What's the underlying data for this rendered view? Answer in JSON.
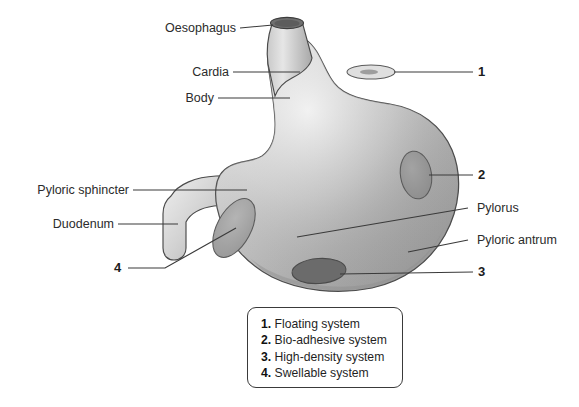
{
  "diagram": {
    "anatomy_labels": [
      {
        "id": "oesophagus",
        "text": "Oesophagus",
        "side": "left"
      },
      {
        "id": "cardia",
        "text": "Cardia",
        "side": "left"
      },
      {
        "id": "body",
        "text": "Body",
        "side": "left"
      },
      {
        "id": "pyloric-sphincter",
        "text": "Pyloric sphincter",
        "side": "left"
      },
      {
        "id": "duodenum",
        "text": "Duodenum",
        "side": "left"
      },
      {
        "id": "pylorus",
        "text": "Pylorus",
        "side": "right"
      },
      {
        "id": "pyloric-antrum",
        "text": "Pyloric antrum",
        "side": "right"
      }
    ],
    "marker_numbers": [
      {
        "id": "marker-1",
        "text": "1",
        "side": "right"
      },
      {
        "id": "marker-2",
        "text": "2",
        "side": "right"
      },
      {
        "id": "marker-3",
        "text": "3",
        "side": "right"
      },
      {
        "id": "marker-4",
        "text": "4",
        "side": "left"
      }
    ],
    "colors": {
      "outline": "#4a4a4a",
      "organ_light": "#e8e8e8",
      "organ_mid": "#b9b9b9",
      "organ_dark": "#8e8e8e",
      "marker_fill": "#9c9c9c",
      "marker_dark_fill": "#6e6e6e",
      "leader_line": "#3a3a3a",
      "text": "#2b2b2b",
      "background": "#ffffff"
    }
  },
  "legend": {
    "items": [
      {
        "num": "1.",
        "label": "Floating system"
      },
      {
        "num": "2.",
        "label": "Bio-adhesive system"
      },
      {
        "num": "3.",
        "label": "High-density system"
      },
      {
        "num": "4.",
        "label": "Swellable system"
      }
    ]
  }
}
